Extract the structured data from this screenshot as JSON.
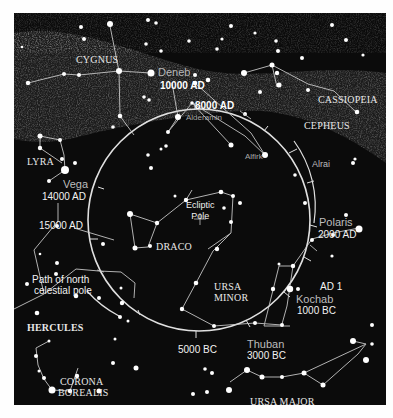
{
  "colors": {
    "background": "#0b0b0b",
    "page": "#fefefe",
    "lines": "#d8d8d8",
    "stars": "#ffffff",
    "milky_way": "#3a3a3a"
  },
  "constellations": {
    "cygnus": "CYGNUS",
    "cassiopeia": "CASSIOPEIA",
    "cepheus": "CEPHEUS",
    "lyra": "LYRA",
    "draco": "DRACO",
    "ursa_minor_1": "URSA",
    "ursa_minor_2": "MINOR",
    "hercules": "HERCULES",
    "corona_1": "CORONA",
    "corona_2": "BOREALIS",
    "ursa_major": "URSA MAJOR"
  },
  "stars": {
    "deneb": "Deneb",
    "alderamin": "Alderamin",
    "alfirk": "Alfirk",
    "alrai": "Alrai",
    "vega": "Vega",
    "polaris": "Polaris",
    "kochab": "Kochab",
    "thuban": "Thuban"
  },
  "dates": {
    "d10000ad": "10000 AD",
    "d8000ad": "8000 AD",
    "d14000ad": "14000 AD",
    "d15000ad": "15000 AD",
    "d2000ad": "2000 AD",
    "ad1": "AD 1",
    "d1000bc": "1000 BC",
    "d3000bc": "3000 BC",
    "d5000bc": "5000 BC"
  },
  "annotations": {
    "ecliptic_1": "Ecliptic",
    "ecliptic_2": "Pole",
    "path_1": "Path of north",
    "path_2": "celestial pole"
  }
}
